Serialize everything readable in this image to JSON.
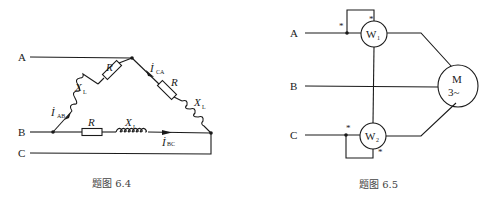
{
  "figure_left": {
    "caption": "题图 6.4",
    "terminals": {
      "a": "A",
      "b": "B",
      "c": "C"
    },
    "branch_ab": {
      "current": "İ",
      "current_sub": "AB",
      "inductor": "X",
      "inductor_sub": "L",
      "resistor": "R"
    },
    "branch_ca": {
      "current": "İ",
      "current_sub": "CA",
      "inductor": "X",
      "inductor_sub": "L",
      "resistor": "R"
    },
    "branch_bc": {
      "current": "İ",
      "current_sub": "BC",
      "inductor": "X",
      "inductor_sub": "L",
      "resistor": "R"
    }
  },
  "figure_right": {
    "caption": "题图 6.5",
    "terminals": {
      "a": "A",
      "b": "B",
      "c": "C"
    },
    "wattmeter1": {
      "label": "W",
      "sub": "1",
      "star": "*"
    },
    "wattmeter2": {
      "label": "W",
      "sub": "2",
      "star": "*"
    },
    "motor": {
      "line1": "M",
      "line2": "3~"
    }
  }
}
